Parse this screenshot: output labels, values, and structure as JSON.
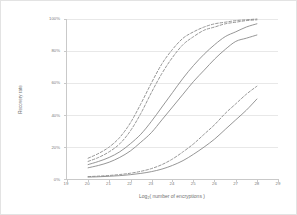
{
  "chart_data": {
    "type": "line",
    "title": "",
    "xlabel": "Log2( number of encryptions )",
    "xlabel_base": "Log",
    "xlabel_sub": "2",
    "xlabel_rest": "( number of encryptions )",
    "ylabel": "Recovery rate",
    "xlim": [
      19,
      29
    ],
    "ylim": [
      0,
      100
    ],
    "xticks": [
      19,
      20,
      21,
      22,
      23,
      24,
      25,
      26,
      27,
      28,
      29
    ],
    "xticklabels": [
      "19",
      "20",
      "21",
      "22",
      "23",
      "24",
      "25",
      "26",
      "27",
      "28",
      "29"
    ],
    "yticks": [
      0,
      20,
      40,
      60,
      80,
      100
    ],
    "yticklabels": [
      "0%",
      "20%",
      "40%",
      "60%",
      "80%",
      "100%"
    ],
    "grid": "horizontal",
    "legend": "none",
    "line_color": "#8a8a8a",
    "grid_color": "#e8e8e8",
    "axis_color": "#c9c9c9",
    "x": [
      20,
      20.5,
      21,
      21.5,
      22,
      22.5,
      23,
      23.5,
      24,
      24.5,
      25,
      25.5,
      26,
      26.5,
      27,
      27.5,
      28
    ],
    "series": [
      {
        "name": "dashed-upper-1",
        "style": "dashed",
        "values": [
          13,
          16,
          20,
          26,
          35,
          47,
          60,
          72,
          81,
          88,
          92,
          95,
          97,
          98,
          99,
          99.5,
          100
        ]
      },
      {
        "name": "dashed-upper-2",
        "style": "dashed",
        "values": [
          11,
          13.5,
          17,
          22,
          30,
          41,
          54,
          66,
          76,
          84,
          89,
          93,
          95,
          97,
          98,
          99,
          99.5
        ]
      },
      {
        "name": "solid-mid-1",
        "style": "solid",
        "values": [
          9,
          11,
          13.5,
          17,
          22,
          28,
          36,
          45,
          54,
          63,
          71,
          78,
          84,
          89,
          92,
          95,
          97
        ]
      },
      {
        "name": "solid-mid-2",
        "style": "solid",
        "values": [
          7,
          8.5,
          10.5,
          13.5,
          17.5,
          23,
          29,
          37,
          45,
          53,
          61,
          68,
          75,
          81,
          86,
          88,
          90
        ]
      },
      {
        "name": "dashed-lower",
        "style": "dashed",
        "values": [
          1.5,
          1.8,
          2.2,
          2.8,
          3.6,
          4.8,
          6.5,
          9,
          12.5,
          17,
          22,
          28,
          34,
          41,
          47,
          53,
          58
        ]
      },
      {
        "name": "solid-lower",
        "style": "solid",
        "values": [
          1.2,
          1.4,
          1.7,
          2.1,
          2.7,
          3.5,
          4.6,
          6.2,
          8.5,
          11.5,
          15.5,
          20,
          25,
          31,
          37,
          43,
          50
        ]
      }
    ]
  }
}
